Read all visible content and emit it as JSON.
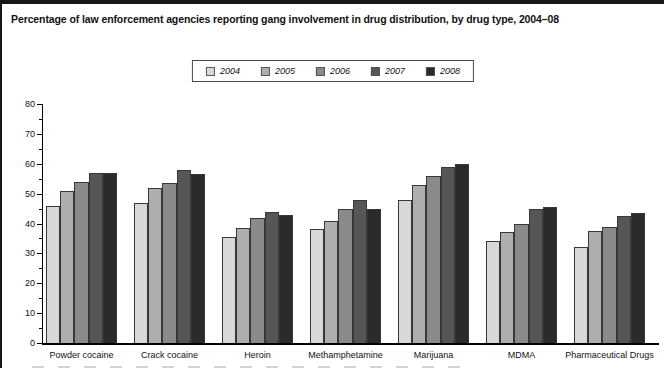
{
  "chart_data": {
    "type": "bar",
    "title": "Percentage of law enforcement agencies reporting gang involvement in drug distribution, by drug type, 2004–08",
    "categories": [
      "Powder cocaine",
      "Crack cocaine",
      "Heroin",
      "Methamphetamine",
      "Marijuana",
      "MDMA",
      "Pharmaceutical Drugs"
    ],
    "series": [
      {
        "name": "2004",
        "color": "#d8d8d8",
        "values": [
          46,
          47,
          35.5,
          38,
          48,
          34,
          32
        ]
      },
      {
        "name": "2005",
        "color": "#aeaeae",
        "values": [
          51,
          52,
          38.5,
          41,
          53,
          37,
          37.5
        ]
      },
      {
        "name": "2006",
        "color": "#8a8a8a",
        "values": [
          54,
          53.5,
          42,
          45,
          56,
          40,
          39
        ]
      },
      {
        "name": "2007",
        "color": "#565656",
        "values": [
          57,
          58,
          44,
          48,
          59,
          45,
          42.5
        ]
      },
      {
        "name": "2008",
        "color": "#2a2a2a",
        "values": [
          57,
          56.5,
          43,
          45,
          60,
          45.5,
          43.5
        ]
      }
    ],
    "xlabel": "",
    "ylabel": "",
    "ylim": [
      0,
      80
    ],
    "yticks": [
      0,
      10,
      20,
      30,
      40,
      50,
      60,
      70,
      80
    ],
    "minor_tick_step": 5,
    "grid": false,
    "legend_position": "top-center",
    "bar_outline_color": "#383838",
    "axis_color": "#000000"
  }
}
